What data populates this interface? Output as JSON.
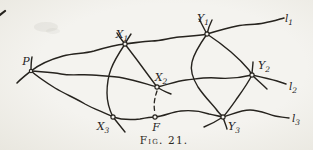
{
  "figure": {
    "caption": "Fig. 21."
  },
  "colors": {
    "ink": "#26231e",
    "paper": "#f2f1ed"
  },
  "point_labels": {
    "p": {
      "base": "P",
      "sub": ""
    },
    "x1": {
      "base": "X",
      "sub": "1"
    },
    "x2": {
      "base": "X",
      "sub": "2"
    },
    "x3": {
      "base": "X",
      "sub": "3"
    },
    "y1": {
      "base": "Y",
      "sub": "1"
    },
    "y2": {
      "base": "Y",
      "sub": "2"
    },
    "y3": {
      "base": "Y",
      "sub": "3"
    },
    "f": {
      "base": "F",
      "sub": ""
    }
  },
  "line_labels": {
    "l1": {
      "base": "l",
      "sub": "1"
    },
    "l2": {
      "base": "l",
      "sub": "2"
    },
    "l3": {
      "base": "l",
      "sub": "3"
    }
  }
}
